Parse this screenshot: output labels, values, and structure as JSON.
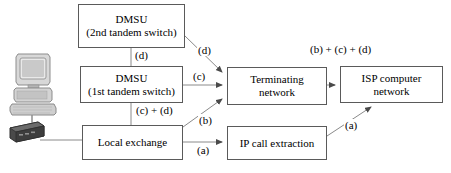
{
  "diagram": {
    "type": "flow-diagram",
    "background_color": "#ffffff",
    "box_border_color": "#5a5a5a",
    "line_color": "#7a7a7a",
    "text_color": "#000000",
    "nodes": [
      {
        "id": "dmsu2",
        "label_line1": "DMSU",
        "label_line2": "(2nd tandem switch)",
        "x": 78,
        "y": 4,
        "w": 107,
        "h": 44
      },
      {
        "id": "dmsu1",
        "label_line1": "DMSU",
        "label_line2": "(1st tandem switch)",
        "x": 80,
        "y": 66,
        "w": 103,
        "h": 37
      },
      {
        "id": "local_exchange",
        "label_line1": "Local exchange",
        "label_line2": "",
        "x": 82,
        "y": 125,
        "w": 101,
        "h": 35
      },
      {
        "id": "terminating_network",
        "label_line1": "Terminating",
        "label_line2": "network",
        "x": 227,
        "y": 67,
        "w": 100,
        "h": 38
      },
      {
        "id": "isp_network",
        "label_line1": "ISP computer",
        "label_line2": "network",
        "x": 340,
        "y": 66,
        "w": 103,
        "h": 37
      },
      {
        "id": "ip_call_extraction",
        "label_line1": "IP call extraction",
        "label_line2": "",
        "x": 227,
        "y": 126,
        "w": 100,
        "h": 34
      }
    ],
    "edge_labels": [
      {
        "id": "label-d-vertical",
        "text": "(d)",
        "x": 134,
        "y": 49
      },
      {
        "id": "label-d-diagonal",
        "text": "(d)",
        "x": 197,
        "y": 44
      },
      {
        "id": "label-c",
        "text": "(c)",
        "x": 192,
        "y": 70
      },
      {
        "id": "label-c-plus-d",
        "text": "(c) + (d)",
        "x": 135,
        "y": 104
      },
      {
        "id": "label-b",
        "text": "(b)",
        "x": 198,
        "y": 114
      },
      {
        "id": "label-a-bottom",
        "text": "(a)",
        "x": 196,
        "y": 144
      },
      {
        "id": "label-b-c-d",
        "text": "(b) + (c) + (d)",
        "x": 309,
        "y": 43
      },
      {
        "id": "label-a-diagonal",
        "text": "(a)",
        "x": 344,
        "y": 119
      }
    ],
    "icons": {
      "workstation": "computer-workstation-icon",
      "modem": "modem-icon"
    }
  }
}
